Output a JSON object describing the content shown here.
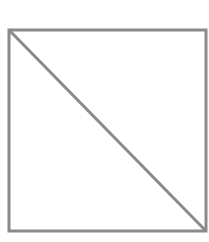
{
  "diagram": {
    "type": "square-with-diagonal",
    "stroke_color": "#8a8a8a",
    "background": "#ffffff",
    "square": {
      "x": 9,
      "y": 30,
      "width": 197,
      "height": 201,
      "stroke_width": 3
    },
    "diagonal": {
      "x1": 10,
      "y1": 31,
      "x2": 205,
      "y2": 230,
      "stroke_width": 3
    }
  }
}
